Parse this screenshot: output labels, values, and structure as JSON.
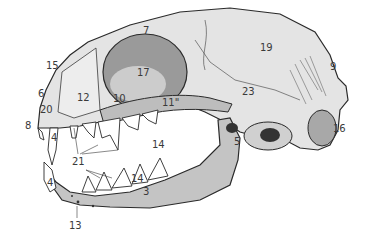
{
  "diagram": {
    "colors": {
      "background": "#ffffff",
      "cranium_fill": "#e4e4e4",
      "mandible_fill": "#c4c4c4",
      "outline": "#2a2a2a",
      "shade": "#8a8a8a",
      "tooth_fill": "#ffffff",
      "label_color": "#3a3a3a"
    },
    "labels": [
      {
        "id": "7",
        "text": "7",
        "x": 143,
        "y": 26
      },
      {
        "id": "19",
        "text": "19",
        "x": 260,
        "y": 43
      },
      {
        "id": "15",
        "text": "15",
        "x": 46,
        "y": 61
      },
      {
        "id": "9",
        "text": "9",
        "x": 330,
        "y": 62
      },
      {
        "id": "17",
        "text": "17",
        "x": 137,
        "y": 68
      },
      {
        "id": "6",
        "text": "6",
        "x": 38,
        "y": 89
      },
      {
        "id": "12",
        "text": "12",
        "x": 77,
        "y": 93
      },
      {
        "id": "23",
        "text": "23",
        "x": 242,
        "y": 87
      },
      {
        "id": "10",
        "text": "10",
        "x": 113,
        "y": 94
      },
      {
        "id": "11",
        "text": "11\"",
        "x": 162,
        "y": 98
      },
      {
        "id": "20",
        "text": "20",
        "x": 40,
        "y": 105
      },
      {
        "id": "8",
        "text": "8",
        "x": 25,
        "y": 121
      },
      {
        "id": "16",
        "text": "16",
        "x": 333,
        "y": 124
      },
      {
        "id": "4a",
        "text": "4",
        "x": 51,
        "y": 133
      },
      {
        "id": "5",
        "text": "5",
        "x": 234,
        "y": 137
      },
      {
        "id": "14a",
        "text": "14",
        "x": 152,
        "y": 140
      },
      {
        "id": "21",
        "text": "21",
        "x": 72,
        "y": 157
      },
      {
        "id": "4b",
        "text": "4",
        "x": 47,
        "y": 178
      },
      {
        "id": "14b",
        "text": "14",
        "x": 131,
        "y": 174
      },
      {
        "id": "3",
        "text": "3",
        "x": 143,
        "y": 187
      },
      {
        "id": "13",
        "text": "13",
        "x": 69,
        "y": 221
      }
    ]
  }
}
